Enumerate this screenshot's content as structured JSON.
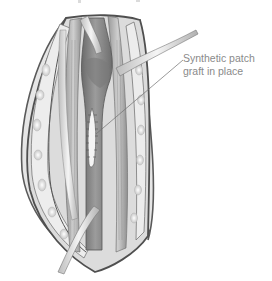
{
  "figure": {
    "callouts": [
      {
        "label": "Synthetic patch\ngraft in place"
      }
    ],
    "colors": {
      "background": "#ffffff",
      "label_text": "#8a8a8a",
      "leader_line": "#6f6f6f",
      "tissue_dark": "#6b6b6b",
      "tissue_mid": "#a3a3a3",
      "tissue_light": "#d9d9d9",
      "skin_edge": "#555555",
      "patch": "#f2f2f2"
    }
  }
}
